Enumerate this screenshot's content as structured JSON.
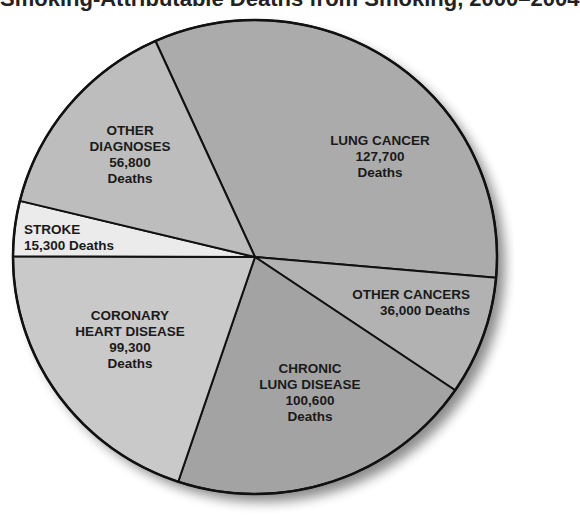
{
  "title": "Smoking-Attributable Deaths from Smoking, 2000–2004",
  "chart_data": {
    "type": "pie",
    "unit": "Deaths",
    "categories": [
      "Lung Cancer",
      "Other Cancers",
      "Chronic Lung Disease",
      "Coronary Heart Disease",
      "Stroke",
      "Other Diagnoses"
    ],
    "values": [
      127700,
      36000,
      100600,
      99300,
      15300,
      56800
    ],
    "labels": [
      {
        "lines": [
          "LUNG CANCER",
          "127,700",
          "Deaths"
        ]
      },
      {
        "lines": [
          "OTHER CANCERS",
          "36,000 Deaths"
        ]
      },
      {
        "lines": [
          "CHRONIC",
          "LUNG DISEASE",
          "100,600",
          "Deaths"
        ]
      },
      {
        "lines": [
          "CORONARY",
          "HEART DISEASE",
          "99,300",
          "Deaths"
        ]
      },
      {
        "lines": [
          "STROKE",
          "15,300 Deaths"
        ]
      },
      {
        "lines": [
          "OTHER",
          "DIAGNOSES",
          "56,800",
          "Deaths"
        ]
      }
    ],
    "colors": [
      "#ababab",
      "#b2b2b2",
      "#a3a3a3",
      "#c9c9c9",
      "#ebebeb",
      "#bdbdbd"
    ],
    "legend": "none (labels inside slices)",
    "grid": false
  }
}
